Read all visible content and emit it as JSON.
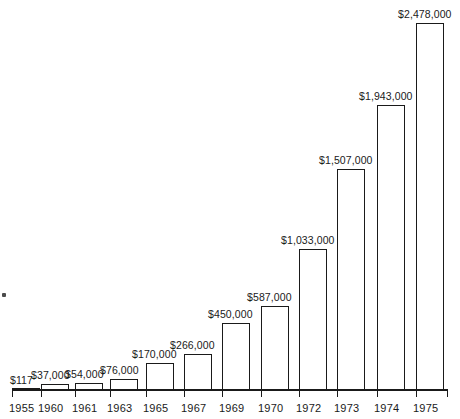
{
  "chart_data": {
    "type": "bar",
    "title": "",
    "subtitle": "",
    "xlabel": "",
    "ylabel": "",
    "grid": false,
    "legend": "none",
    "categories": [
      "1955",
      "1960",
      "1961",
      "1963",
      "1965",
      "1967",
      "1969",
      "1970",
      "1972",
      "1973",
      "1974",
      "1975"
    ],
    "values": [
      117,
      37000,
      54000,
      76000,
      170000,
      266000,
      450000,
      587000,
      1033000,
      1507000,
      1943000,
      2478000
    ],
    "value_labels": [
      "$117",
      "$37,000",
      "$54,000",
      "$76,000",
      "$170,000",
      "$266,000",
      "$450,000",
      "$587,000",
      "$1,033,000",
      "$1,507,000",
      "$1,943,000",
      "$2,478,000"
    ],
    "ylim": [
      0,
      2478000
    ],
    "bar_style": {
      "fill": "#ffffff",
      "stroke": "#1a1a1a",
      "stroke_width": 1.4
    },
    "axis_color": "#1a1a1a",
    "background": "#ffffff"
  },
  "bars": [
    {
      "category": "1955",
      "label": "$117",
      "x": 12,
      "width": 28,
      "top": 389,
      "label_x": 10,
      "label_y": 374,
      "tick_x": 12,
      "tick_label_x": 9,
      "zero": true
    },
    {
      "category": "1960",
      "label": "$37,000",
      "x": 41,
      "width": 28,
      "top": 384,
      "label_x": 31,
      "label_y": 369,
      "tick_x": 41,
      "tick_label_x": 38,
      "zero": false
    },
    {
      "category": "1961",
      "label": "$54,000",
      "x": 75,
      "width": 28,
      "top": 383,
      "label_x": 65,
      "label_y": 368,
      "tick_x": 75,
      "tick_label_x": 72,
      "zero": false
    },
    {
      "category": "1963",
      "label": "$76,000",
      "x": 110,
      "width": 28,
      "top": 379,
      "label_x": 100,
      "label_y": 364,
      "tick_x": 110,
      "tick_label_x": 107,
      "zero": false
    },
    {
      "category": "1965",
      "label": "$170,000",
      "x": 146,
      "width": 28,
      "top": 363,
      "label_x": 132,
      "label_y": 348,
      "tick_x": 146,
      "tick_label_x": 143,
      "zero": false
    },
    {
      "category": "1967",
      "label": "$266,000",
      "x": 184,
      "width": 28,
      "top": 354,
      "label_x": 170,
      "label_y": 339,
      "tick_x": 184,
      "tick_label_x": 181,
      "zero": false
    },
    {
      "category": "1969",
      "label": "$450,000",
      "x": 222,
      "width": 28,
      "top": 323,
      "label_x": 208,
      "label_y": 308,
      "tick_x": 222,
      "tick_label_x": 219,
      "zero": false
    },
    {
      "category": "1970",
      "label": "$587,000",
      "x": 261,
      "width": 28,
      "top": 306,
      "label_x": 247,
      "label_y": 291,
      "tick_x": 261,
      "tick_label_x": 258,
      "zero": false
    },
    {
      "category": "1972",
      "label": "$1,033,000",
      "x": 299,
      "width": 28,
      "top": 249,
      "label_x": 281,
      "label_y": 234,
      "tick_x": 299,
      "tick_label_x": 296,
      "zero": false
    },
    {
      "category": "1973",
      "label": "$1,507,000",
      "x": 337,
      "width": 28,
      "top": 169,
      "label_x": 319,
      "label_y": 154,
      "tick_x": 337,
      "tick_label_x": 334,
      "zero": false
    },
    {
      "category": "1974",
      "label": "$1,943,000",
      "x": 377,
      "width": 28,
      "top": 105,
      "label_x": 359,
      "label_y": 90,
      "tick_x": 377,
      "tick_label_x": 374,
      "zero": false
    },
    {
      "category": "1975",
      "label": "$2,478,000",
      "x": 416,
      "width": 28,
      "top": 23,
      "label_x": 398,
      "label_y": 8,
      "tick_x": 416,
      "tick_label_x": 413,
      "zero": false
    }
  ]
}
